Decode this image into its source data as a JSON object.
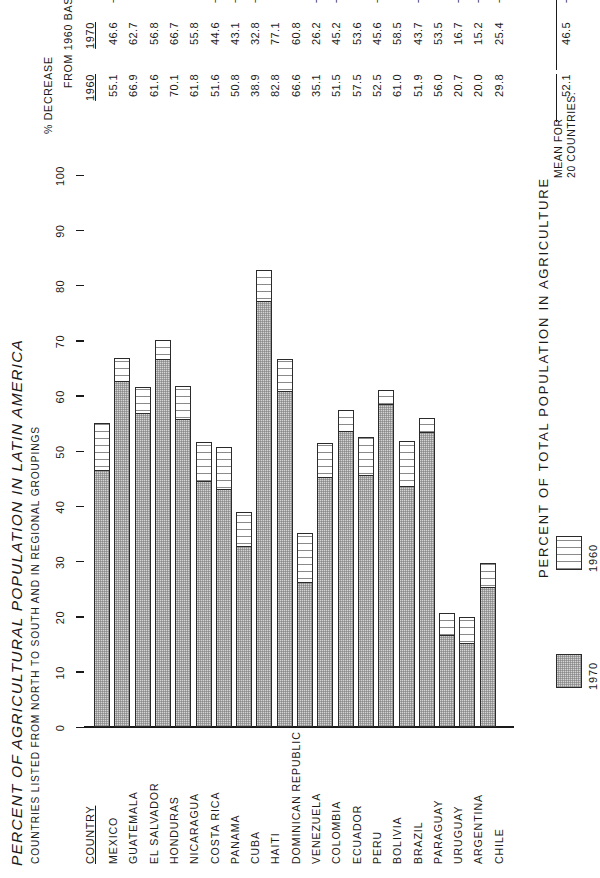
{
  "chart_data": {
    "type": "bar",
    "title": "PERCENT OF AGRICULTURAL POPULATION IN LATIN AMERICA",
    "subtitle": "COUNTRIES LISTED FROM NORTH TO SOUTH AND IN REGIONAL GROUPINGS",
    "xlabel": "PERCENT OF TOTAL POPULATION IN AGRICULTURE",
    "ylabel": "",
    "orientation": "horizontal",
    "stacked": true,
    "grid": false,
    "xlim": [
      0,
      100
    ],
    "xticks": [
      "0",
      "10",
      "20",
      "30",
      "40",
      "50",
      "60",
      "70",
      "80",
      "90",
      "100"
    ],
    "legend_position": "below-axis",
    "categories": [
      "MEXICO",
      "GUATEMALA",
      "EL SALVADOR",
      "HONDURAS",
      "NICARAGUA",
      "COSTA RICA",
      "PANAMA",
      "CUBA",
      "HAITI",
      "DOMINICAN REPUBLIC",
      "VENEZUELA",
      "COLOMBIA",
      "ECUADOR",
      "PERU",
      "BOLIVIA",
      "BRAZIL",
      "PARAGUAY",
      "URUGUAY",
      "ARGENTINA",
      "CHILE"
    ],
    "series": [
      {
        "name": "1970",
        "values": [
          46.6,
          62.7,
          56.8,
          66.7,
          55.8,
          44.6,
          43.1,
          32.8,
          77.1,
          60.8,
          26.2,
          45.2,
          53.6,
          45.6,
          58.5,
          43.7,
          53.5,
          16.7,
          15.2,
          25.4
        ]
      },
      {
        "name": "1960",
        "values": [
          55.1,
          66.9,
          61.6,
          70.1,
          61.8,
          51.6,
          50.8,
          38.9,
          82.8,
          66.6,
          35.1,
          51.5,
          57.5,
          52.5,
          61.0,
          51.9,
          56.0,
          20.7,
          20.0,
          29.8
        ]
      }
    ],
    "annotations": [
      "MEAN FOR 20 COUNTRIES:"
    ]
  },
  "table": {
    "headers": {
      "country": "COUNTRY",
      "y1960": "1960",
      "y1970": "1970",
      "decrease_line1": "% DECREASE",
      "decrease_line2": "FROM 1960 BASE"
    },
    "rows": [
      {
        "country": "MEXICO",
        "y1960": "55.1",
        "y1970": "46.6",
        "decrease": "− 15.4"
      },
      {
        "country": "GUATEMALA",
        "y1960": "66.9",
        "y1970": "62.7",
        "decrease": "−  6.3"
      },
      {
        "country": "EL SALVADOR",
        "y1960": "61.6",
        "y1970": "56.8",
        "decrease": "−  7.8"
      },
      {
        "country": "HONDURAS",
        "y1960": "70.1",
        "y1970": "66.7",
        "decrease": "−  4.9"
      },
      {
        "country": "NICARAGUA",
        "y1960": "61.8",
        "y1970": "55.8",
        "decrease": "−  9.7"
      },
      {
        "country": "COSTA RICA",
        "y1960": "51.6",
        "y1970": "44.6",
        "decrease": "− 13.6"
      },
      {
        "country": "PANAMA",
        "y1960": "50.8",
        "y1970": "43.1",
        "decrease": "− 15.2"
      },
      {
        "country": "CUBA",
        "y1960": "38.9",
        "y1970": "32.8",
        "decrease": "− 15.7"
      },
      {
        "country": "HAITI",
        "y1960": "82.8",
        "y1970": "77.1",
        "decrease": "−  6.9"
      },
      {
        "country": "DOMINICAN REPUBLIC",
        "y1960": "66.6",
        "y1970": "60.8",
        "decrease": "−  8.7"
      },
      {
        "country": "VENEZUELA",
        "y1960": "35.1",
        "y1970": "26.2",
        "decrease": "− 25.4"
      },
      {
        "country": "COLOMBIA",
        "y1960": "51.5",
        "y1970": "45.2",
        "decrease": "− 12.2"
      },
      {
        "country": "ECUADOR",
        "y1960": "57.5",
        "y1970": "53.6",
        "decrease": "−  6.8"
      },
      {
        "country": "PERU",
        "y1960": "52.5",
        "y1970": "45.6",
        "decrease": "− 13.1"
      },
      {
        "country": "BOLIVIA",
        "y1960": "61.0",
        "y1970": "58.5",
        "decrease": "−  4.4"
      },
      {
        "country": "BRAZIL",
        "y1960": "51.9",
        "y1970": "43.7",
        "decrease": "− 15.8"
      },
      {
        "country": "PARAGUAY",
        "y1960": "56.0",
        "y1970": "53.5",
        "decrease": "−  4.8"
      },
      {
        "country": "URUGUAY",
        "y1960": "20.7",
        "y1970": "16.7",
        "decrease": "− 19.3"
      },
      {
        "country": "ARGENTINA",
        "y1960": "20.0",
        "y1970": "15.2",
        "decrease": "− 24.0"
      },
      {
        "country": "CHILE",
        "y1960": "29.8",
        "y1970": "25.4",
        "decrease": "− 14.8"
      }
    ],
    "mean": {
      "label_line1": "MEAN FOR",
      "label_line2": "20 COUNTRIES:",
      "y1960": "52.1",
      "y1970": "46.5",
      "decrease": "− 10.7"
    }
  },
  "legend": {
    "items": [
      {
        "label": "1970",
        "fill": "#d4d4d4"
      },
      {
        "label": "1960",
        "fill": "#ffffff"
      }
    ]
  }
}
